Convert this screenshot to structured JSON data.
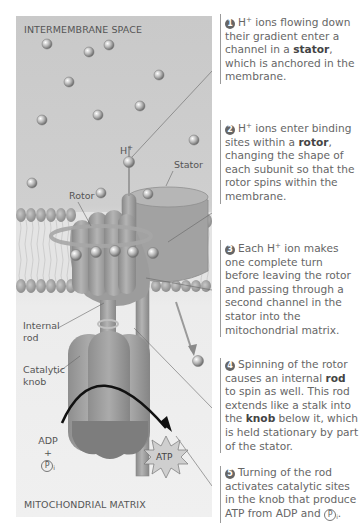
{
  "diagram": {
    "regions": {
      "top": "INTERMEMBRANE SPACE",
      "bottom": "MITOCHONDRIAL MATRIX"
    },
    "labels": {
      "h_ion": "H",
      "h_sup": "+",
      "stator": "Stator",
      "rotor": "Rotor",
      "internal_rod_1": "Internal",
      "internal_rod_2": "rod",
      "catalytic_knob_1": "Catalytic",
      "catalytic_knob_2": "knob",
      "adp": "ADP",
      "plus": "+",
      "pi": "P",
      "pi_sub": "i",
      "atp": "ATP"
    },
    "colors": {
      "panel_bg": "#cfcfcf",
      "protein": "#9a9a9a",
      "ion": "#b8b8b8",
      "arrow": "#111111",
      "step_badge": "#666666"
    }
  },
  "steps": [
    {
      "number": "1",
      "parts": [
        "H",
        "+",
        " ions flowing down their gradient enter a channel in a ",
        "stator",
        ", which is anchored in the membrane."
      ]
    },
    {
      "number": "2",
      "parts": [
        "H",
        "+",
        " ions enter binding sites within a ",
        "rotor",
        ", changing the shape of each subunit so that the rotor spins within the membrane."
      ]
    },
    {
      "number": "3",
      "parts": [
        "Each H",
        "+",
        " ion makes one complete turn before leaving the rotor and passing through a second channel in the stator into the mitochondrial matrix."
      ]
    },
    {
      "number": "4",
      "parts": [
        "Spinning of the rotor causes an internal ",
        "rod",
        " to spin as well. This rod extends like a stalk into the ",
        "knob",
        " below it, which is held stationary by part of the stator."
      ]
    },
    {
      "number": "5",
      "parts": [
        "Turning of the rod activates catalytic sites in the knob that produce ATP from ADP and ",
        "P",
        "i",
        "."
      ]
    }
  ]
}
